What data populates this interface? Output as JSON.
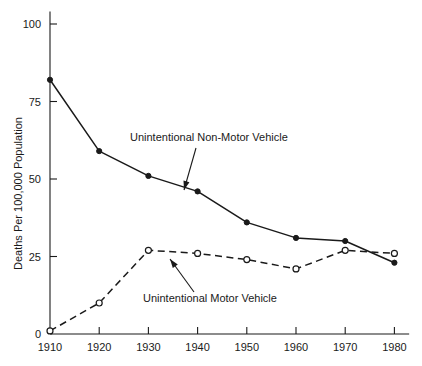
{
  "chart_data": {
    "type": "line",
    "title": "",
    "xlabel": "",
    "ylabel": "Deaths Per 100,000 Population",
    "x": [
      1910,
      1920,
      1930,
      1940,
      1950,
      1960,
      1970,
      1980
    ],
    "xtick_labels": [
      "1910",
      "1920",
      "1930",
      "1940",
      "1950",
      "1960",
      "1970",
      "1980"
    ],
    "ytick_labels": [
      "0",
      "25",
      "50",
      "75",
      "100"
    ],
    "yticks": [
      0,
      25,
      50,
      75,
      100
    ],
    "ylim": [
      0,
      104
    ],
    "xlim": [
      1910,
      1983
    ],
    "grid": false,
    "legend_position": "inline-annotations",
    "series": [
      {
        "name": "Unintentional Non-Motor Vehicle",
        "style": "solid",
        "marker": "filled-circle",
        "color": "#1a1a1a",
        "values": [
          82,
          59,
          51,
          46,
          36,
          31,
          30,
          23
        ]
      },
      {
        "name": "Unintentional Motor Vehicle",
        "style": "dashed",
        "marker": "open-circle",
        "color": "#1a1a1a",
        "values": [
          1,
          10,
          27,
          26,
          24,
          21,
          27,
          26
        ]
      }
    ],
    "annotations": [
      {
        "text": "Unintentional Non-Motor Vehicle",
        "text_x": 130,
        "text_y": 141,
        "arrow_from_x": 196,
        "arrow_from_y": 148,
        "arrow_to_x": 184,
        "arrow_to_y": 190
      },
      {
        "text": "Unintentional Motor Vehicle",
        "text_x": 143,
        "text_y": 302,
        "arrow_from_x": 194,
        "arrow_from_y": 292,
        "arrow_to_x": 170,
        "arrow_to_y": 259
      }
    ]
  },
  "axes": {
    "y_axis_title": "Deaths Per 100,000 Population"
  }
}
